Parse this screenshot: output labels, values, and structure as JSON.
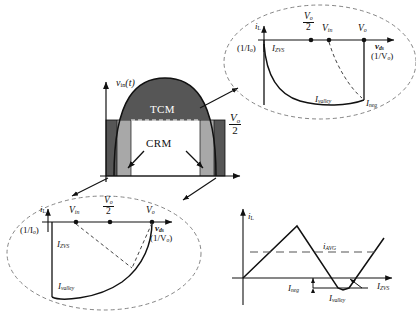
{
  "figure": {
    "kind": "power-electronics-operating-mode-diagram",
    "main_plot": {
      "y_axis_label": "v_in(t)",
      "threshold_label": {
        "numerator": "V",
        "numerator_sub": "o",
        "denominator": "2"
      },
      "region_tcm": "TCM",
      "region_crm": "CRM"
    },
    "inset_tcm": {
      "y_axis_label": "i",
      "y_axis_sub": "L",
      "x_axis_label": "v",
      "x_axis_sub": "ds",
      "x_scale_label": "(1/V",
      "x_scale_sub": "o",
      "y_scale_label": "(1/I",
      "y_scale_sub": "o",
      "ticks": [
        {
          "num": "V",
          "num_sub": "o",
          "den": "2",
          "is_fraction": true
        },
        {
          "base": "V",
          "sub": "in",
          "is_fraction": false
        },
        {
          "base": "V",
          "sub": "o",
          "is_fraction": false
        }
      ],
      "curve_labels": [
        {
          "base": "I",
          "sub": "ZVS"
        },
        {
          "base": "I",
          "sub": "valley"
        },
        {
          "base": "I",
          "sub": "neg"
        }
      ]
    },
    "inset_crm": {
      "y_axis_label": "i",
      "y_axis_sub": "L",
      "x_axis_label": "v",
      "x_axis_sub": "ds",
      "x_scale_label": "(1/V",
      "x_scale_sub": "o",
      "y_scale_label": "(1/I",
      "y_scale_sub": "o",
      "ticks": [
        {
          "base": "V",
          "sub": "in",
          "is_fraction": false
        },
        {
          "num": "V",
          "num_sub": "o",
          "den": "2",
          "is_fraction": true
        },
        {
          "base": "V",
          "sub": "o",
          "is_fraction": false
        }
      ],
      "curve_labels": [
        {
          "base": "I",
          "sub": "ZVS"
        },
        {
          "base": "I",
          "sub": "valley"
        }
      ]
    },
    "waveform": {
      "y_axis_label": "i",
      "y_axis_sub": "L",
      "avg_label": {
        "base": "i",
        "sub": "AVG"
      },
      "markers": [
        {
          "base": "I",
          "sub": "neg"
        },
        {
          "base": "I",
          "sub": "valley"
        },
        {
          "base": "I",
          "sub": "ZVS"
        }
      ]
    },
    "colors": {
      "tcm_fill": "#565656",
      "crm_fill": "#a8a8a8",
      "center_fill": "#ffffff",
      "stroke": "#111111",
      "dash": "#555555"
    }
  }
}
